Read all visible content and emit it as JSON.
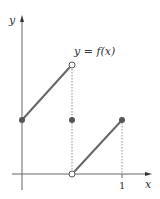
{
  "diagram": {
    "function_label": "y = f(x)",
    "y_axis_label": "y",
    "x_axis_label": "x",
    "x_tick_label": "1",
    "colors": {
      "axis": "#555555",
      "segment": "#666666",
      "point": "#555555",
      "dotted": "#777777"
    }
  }
}
